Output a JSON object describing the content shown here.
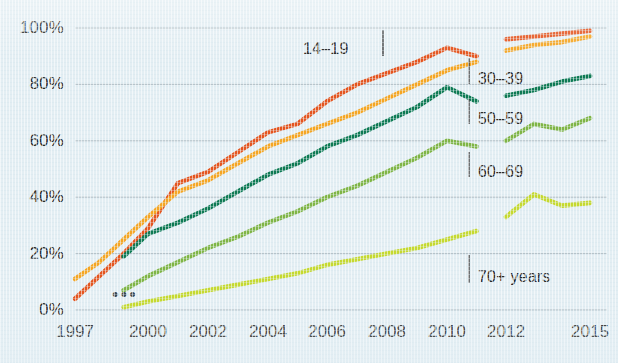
{
  "chart_data": {
    "type": "line",
    "title": "",
    "xlabel": "",
    "ylabel": "",
    "xlim": [
      1997,
      2015
    ],
    "ylim": [
      0,
      100
    ],
    "grid": true,
    "legend_position": "inline-right",
    "ytick_labels": [
      "0%",
      "20%",
      "40%",
      "60%",
      "80%",
      "100%"
    ],
    "ytick_values": [
      0,
      20,
      40,
      60,
      80,
      100
    ],
    "xtick_labels": [
      "1997",
      "2000",
      "2002",
      "2004",
      "2006",
      "2008",
      "2010",
      "2012",
      "2015"
    ],
    "xtick_values": [
      1997,
      2000,
      2002,
      2004,
      2006,
      2008,
      2010,
      2012,
      2015
    ],
    "break_between": [
      2011,
      2012
    ],
    "ellipsis_marker": "•••",
    "series": [
      {
        "name": "14–19",
        "label": "14–19",
        "color": "#e4551f",
        "x": [
          1997,
          1998,
          1999,
          2000,
          2001,
          2002,
          2003,
          2004,
          2005,
          2006,
          2007,
          2008,
          2009,
          2010,
          2011
        ],
        "values": [
          4,
          12,
          20,
          29,
          45,
          49,
          56,
          63,
          66,
          74,
          80,
          84,
          88,
          93,
          90
        ],
        "x2": [
          2012,
          2013,
          2014,
          2015
        ],
        "values2": [
          96,
          97,
          98,
          99
        ]
      },
      {
        "name": "30–39",
        "label": "30–39",
        "color": "#f5a623",
        "x": [
          1997,
          1998,
          1999,
          2000,
          2001,
          2002,
          2003,
          2004,
          2005,
          2006,
          2007,
          2008,
          2009,
          2010,
          2011
        ],
        "values": [
          11,
          17,
          25,
          33,
          42,
          46,
          52,
          58,
          62,
          66,
          70,
          75,
          80,
          85,
          88
        ],
        "x2": [
          2012,
          2013,
          2014,
          2015
        ],
        "values2": [
          92,
          94,
          95,
          97
        ]
      },
      {
        "name": "50–59",
        "label": "50–59",
        "color": "#0e7a54",
        "x": [
          1999,
          2000,
          2001,
          2002,
          2003,
          2004,
          2005,
          2006,
          2007,
          2008,
          2009,
          2010,
          2011
        ],
        "values": [
          19,
          27,
          31,
          36,
          42,
          48,
          52,
          58,
          62,
          67,
          72,
          79,
          74
        ],
        "x2": [
          2012,
          2013,
          2014,
          2015
        ],
        "values2": [
          76,
          78,
          81,
          83
        ]
      },
      {
        "name": "60–69",
        "label": "60–69",
        "color": "#7fb546",
        "x": [
          1999,
          2000,
          2001,
          2002,
          2003,
          2004,
          2005,
          2006,
          2007,
          2008,
          2009,
          2010,
          2011
        ],
        "values": [
          7,
          12,
          17,
          22,
          26,
          31,
          35,
          40,
          44,
          49,
          54,
          60,
          58
        ],
        "x2": [
          2012,
          2013,
          2014,
          2015
        ],
        "values2": [
          60,
          66,
          64,
          68
        ]
      },
      {
        "name": "70+ years",
        "label": "70+ years",
        "color": "#c5d930",
        "x": [
          1999,
          2000,
          2001,
          2002,
          2003,
          2004,
          2005,
          2006,
          2007,
          2008,
          2009,
          2010,
          2011
        ],
        "values": [
          1,
          3,
          5,
          7,
          9,
          11,
          13,
          16,
          18,
          20,
          22,
          25,
          28
        ],
        "x2": [
          2012,
          2013,
          2014,
          2015
        ],
        "values2": [
          33,
          41,
          37,
          38
        ]
      }
    ],
    "annotations": [
      {
        "text": "14–19",
        "for": "14–19",
        "pos": "left-of-line"
      },
      {
        "text": "30–39",
        "for": "30–39",
        "pos": "right-inline"
      },
      {
        "text": "50–59",
        "for": "50–59",
        "pos": "right-inline"
      },
      {
        "text": "60–69",
        "for": "60–69",
        "pos": "right-inline"
      },
      {
        "text": "70+ years",
        "for": "70+ years",
        "pos": "right-inline"
      }
    ]
  },
  "axes": {
    "y_ticks": [
      {
        "label": "100%",
        "value": 100
      },
      {
        "label": "80%",
        "value": 80
      },
      {
        "label": "60%",
        "value": 60
      },
      {
        "label": "40%",
        "value": 40
      },
      {
        "label": "20%",
        "value": 20
      },
      {
        "label": "0%",
        "value": 0
      }
    ],
    "x_ticks": [
      {
        "label": "1997",
        "value": 1997
      },
      {
        "label": "2000",
        "value": 2000
      },
      {
        "label": "2002",
        "value": 2002
      },
      {
        "label": "2004",
        "value": 2004
      },
      {
        "label": "2006",
        "value": 2006
      },
      {
        "label": "2008",
        "value": 2008
      },
      {
        "label": "2010",
        "value": 2010
      },
      {
        "label": "2012",
        "value": 2012
      },
      {
        "label": "2015",
        "value": 2015
      }
    ]
  },
  "colors": {
    "background": "#e3eef3",
    "gridline": "#9aa8b0",
    "text": "#2e2e2e",
    "series_14_19": "#e4551f",
    "series_30_39": "#f5a623",
    "series_50_59": "#0e7a54",
    "series_60_69": "#7fb546",
    "series_70plus": "#c5d930"
  }
}
